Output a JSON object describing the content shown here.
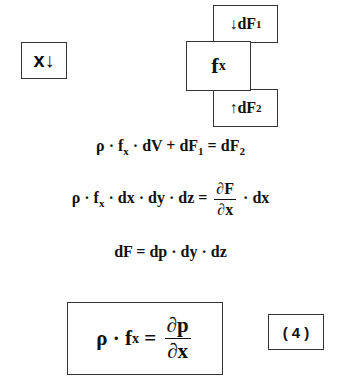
{
  "diagram": {
    "axis_label": {
      "var": "x",
      "arrow": "↓"
    },
    "element_box": {
      "symbol": "f",
      "sub": "x"
    },
    "top_force": {
      "arrow": "↓",
      "symbol": "dF",
      "sub": "1"
    },
    "bottom_force": {
      "arrow": "↑",
      "symbol": "dF",
      "sub": "2"
    }
  },
  "equations": {
    "eq1": {
      "lhs_a": "ρ · f",
      "lhs_sub": "x",
      "lhs_b": " · dV + dF",
      "lhs_sub2": "1",
      "rhs": " = dF",
      "rhs_sub": "2"
    },
    "eq2": {
      "lhs_a": "ρ · f",
      "lhs_sub": "x",
      "lhs_b": " · dx · dy · dz =",
      "num": "∂F",
      "den": "∂x",
      "tail": "· dx"
    },
    "eq3": {
      "text": "dF = dp · dy · dz"
    },
    "final": {
      "lhs_a": "ρ · f",
      "lhs_sub": "x",
      "eq": " = ",
      "num": "∂p",
      "den": "∂x"
    },
    "number": "( 4 )"
  }
}
